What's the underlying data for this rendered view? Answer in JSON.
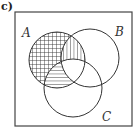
{
  "part_label": "c)",
  "diagram": {
    "type": "venn",
    "sets": [
      {
        "name": "A",
        "label": "A"
      },
      {
        "name": "B",
        "label": "B"
      },
      {
        "name": "C",
        "label": "C"
      }
    ],
    "shaded_regions": [
      {
        "region": "A only (excluding B and C)",
        "pattern": "crosshatch"
      },
      {
        "region": "A ∩ B excluding C",
        "pattern": "vertical-lines"
      },
      {
        "region": "A ∩ C excluding B",
        "pattern": "horizontal-lines"
      }
    ],
    "colors": {
      "line": "#333333",
      "background": "#ffffff"
    }
  }
}
